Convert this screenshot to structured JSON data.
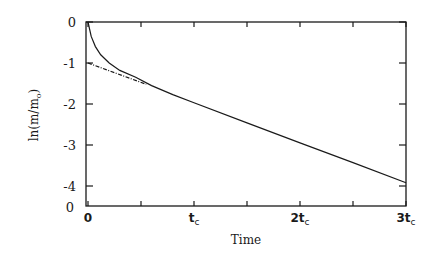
{
  "chart_data": {
    "type": "line",
    "title": "",
    "xlabel": "Time",
    "ylabel": "ln(m/m",
    "ylabel_subscript": "o",
    "ylabel_close": ")",
    "xlim": [
      0,
      3
    ],
    "ylim": [
      -4.5,
      0
    ],
    "y_ticks": [
      {
        "value": 0,
        "label": "0"
      },
      {
        "value": -1,
        "label": "-1"
      },
      {
        "value": -2,
        "label": "-2"
      },
      {
        "value": -3,
        "label": "-3"
      },
      {
        "value": -4,
        "label": "-4"
      }
    ],
    "y_origin_label": "0",
    "x_ticks": [
      {
        "value": 0,
        "label": "0",
        "sub": ""
      },
      {
        "value": 0.5,
        "label": "",
        "sub": ""
      },
      {
        "value": 1,
        "label": "t",
        "sub": "c"
      },
      {
        "value": 1.5,
        "label": "",
        "sub": ""
      },
      {
        "value": 2,
        "label": "2t",
        "sub": "c"
      },
      {
        "value": 2.5,
        "label": "",
        "sub": ""
      },
      {
        "value": 3,
        "label": "3t",
        "sub": "c"
      }
    ],
    "x_unit": "t_c",
    "grid": false,
    "legend": null,
    "series": [
      {
        "name": "ln(m/m0) measured (solid)",
        "style": "solid",
        "x": [
          0,
          0.03,
          0.07,
          0.12,
          0.2,
          0.3,
          0.45,
          0.6,
          0.8,
          1.0,
          1.5,
          2.0,
          2.5,
          3.0
        ],
        "y": [
          0,
          -0.35,
          -0.6,
          -0.8,
          -1.0,
          -1.18,
          -1.35,
          -1.55,
          -1.77,
          -1.97,
          -2.46,
          -2.95,
          -3.43,
          -3.92
        ]
      },
      {
        "name": "linear extrapolation (dashed)",
        "style": "dashed",
        "x": [
          0,
          0.55
        ],
        "y": [
          -1.0,
          -1.52
        ]
      }
    ]
  }
}
